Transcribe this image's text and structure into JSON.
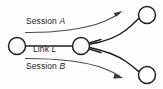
{
  "diagram": {
    "type": "network-topology",
    "background_color": "#fefefe",
    "stroke_color": "#231f20",
    "session_stroke_color": "#4a4a4a",
    "labels": {
      "session_a": {
        "text": "Session ",
        "variable": "A"
      },
      "link_l": {
        "text": "Link ",
        "variable": "L"
      },
      "session_b": {
        "text": "Session ",
        "variable": "B"
      }
    },
    "nodes": [
      {
        "id": "left-node",
        "cx": 17,
        "cy": 46,
        "r": 8.5
      },
      {
        "id": "center-node",
        "cx": 81,
        "cy": 46,
        "r": 8.5
      },
      {
        "id": "top-right-node",
        "cx": 147,
        "cy": 15,
        "r": 8.5
      },
      {
        "id": "bottom-right-node",
        "cx": 147,
        "cy": 75,
        "r": 8.5
      }
    ],
    "edges": [
      {
        "id": "link-l-edge",
        "kind": "straight",
        "from": "left-node",
        "to": "center-node"
      },
      {
        "id": "branch-up-edge",
        "kind": "curve",
        "from": "center-node",
        "to": "top-right-node"
      },
      {
        "id": "branch-down-edge",
        "kind": "curve",
        "from": "center-node",
        "to": "bottom-right-node"
      },
      {
        "id": "center-stub-up",
        "kind": "stub",
        "from": "center-node"
      },
      {
        "id": "center-stub-down",
        "kind": "stub",
        "from": "center-node"
      }
    ],
    "session_arrows": [
      {
        "id": "session-a-arrow",
        "label": "Session A",
        "direction": "up-right",
        "head_x": 121,
        "head_y": 12
      },
      {
        "id": "session-b-arrow",
        "label": "Session B",
        "direction": "down-right",
        "head_x": 123,
        "head_y": 76
      }
    ]
  }
}
